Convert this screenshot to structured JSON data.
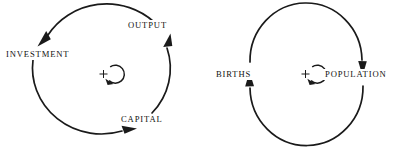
{
  "figure": {
    "name": "reinforcing-feedback-loops",
    "background_color": "#ffffff",
    "ink_color": "#1a1a1a"
  },
  "diagrams": [
    {
      "id": "loop-investment-output-capital",
      "polarity_symbol": "+",
      "polarity_direction": "clockwise",
      "nodes": [
        {
          "id": "investment",
          "label": "INVESTMENT"
        },
        {
          "id": "output",
          "label": "OUTPUT"
        },
        {
          "id": "capital",
          "label": "CAPITAL"
        }
      ],
      "links": [
        {
          "from": "capital",
          "to": "output"
        },
        {
          "from": "output",
          "to": "investment"
        },
        {
          "from": "investment",
          "to": "capital"
        }
      ]
    },
    {
      "id": "loop-births-population",
      "polarity_symbol": "+",
      "polarity_direction": "clockwise",
      "nodes": [
        {
          "id": "births",
          "label": "BIRTHS"
        },
        {
          "id": "population",
          "label": "POPULATION"
        }
      ],
      "links": [
        {
          "from": "births",
          "to": "population"
        },
        {
          "from": "population",
          "to": "births"
        }
      ]
    }
  ]
}
